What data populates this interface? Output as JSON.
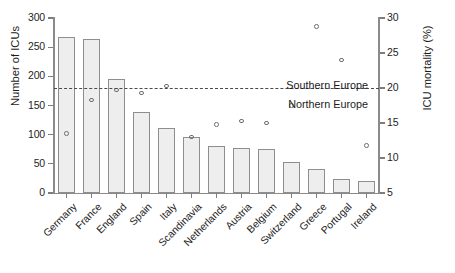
{
  "chart_data": {
    "type": "bar",
    "title": "",
    "xlabel": "",
    "ylabel": "Number of ICUs",
    "ylabel_right": "ICU mortality (%)",
    "categories": [
      "Germany",
      "France",
      "England",
      "Spain",
      "Italy",
      "Scandinavia",
      "Netherlands",
      "Austria",
      "Belgium",
      "Switzerland",
      "Greece",
      "Portugal",
      "Ireland"
    ],
    "series": [
      {
        "name": "Number of ICUs",
        "type": "bar",
        "axis": "left",
        "values": [
          268,
          264,
          195,
          139,
          112,
          96,
          80,
          78,
          76,
          53,
          41,
          24,
          21
        ]
      },
      {
        "name": "ICU mortality (%)",
        "type": "scatter",
        "axis": "right",
        "values": [
          13.5,
          18.3,
          19.7,
          19.3,
          20.3,
          13.0,
          14.8,
          15.3,
          15.0,
          17.5,
          28.8,
          24.0,
          11.8
        ]
      }
    ],
    "ylim": [
      0,
      300
    ],
    "yticks": [
      0,
      50,
      100,
      150,
      200,
      250,
      300
    ],
    "ylim_right": [
      5,
      30
    ],
    "yticks_right": [
      5,
      10,
      15,
      20,
      25,
      30
    ],
    "grid": false,
    "legend": "none",
    "annotations": [
      {
        "name": "reference-line",
        "type": "hline",
        "axis": "left",
        "value": 180,
        "right_axis_value": 20,
        "style": "dashed"
      },
      {
        "name": "southern-europe-label",
        "text": "Southern Europe",
        "position": "above-line"
      },
      {
        "name": "northern-europe-label",
        "text": "Northern Europe",
        "position": "below-line"
      }
    ]
  },
  "axes": {
    "left": {
      "title": "Number of ICUs",
      "ticks": [
        "300",
        "250",
        "200",
        "150",
        "100",
        "50",
        "0"
      ]
    },
    "right": {
      "title": "ICU mortality (%)",
      "ticks": [
        "30",
        "25",
        "20",
        "15",
        "10",
        "5"
      ]
    },
    "x": {
      "ticks": [
        "Germany",
        "France",
        "England",
        "Spain",
        "Italy",
        "Scandinavia",
        "Netherlands",
        "Austria",
        "Belgium",
        "Switzerland",
        "Greece",
        "Portugal",
        "Ireland"
      ]
    }
  },
  "annotations": {
    "southern": "Southern Europe",
    "northern": "Northern Europe"
  },
  "colors": {
    "bar_fill": "#eeeeee",
    "bar_stroke": "#8e8e8e",
    "point_stroke": "#6e6e6e",
    "axis": "#8a8a8a",
    "reference_line": "#4a4a4a",
    "text": "#1b1b1b",
    "background": "#ffffff"
  }
}
